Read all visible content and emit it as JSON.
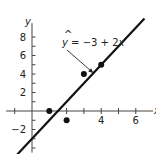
{
  "chart_data": {
    "type": "scatter",
    "title": "",
    "xlabel": "x",
    "ylabel": "y",
    "xlim": [
      -1.5,
      7
    ],
    "ylim": [
      -4.5,
      9.5
    ],
    "grid": false,
    "x_ticks": [
      -1,
      1,
      2,
      3,
      4,
      5,
      6
    ],
    "x_tick_labels": [
      {
        "value": 4,
        "label": "4"
      },
      {
        "value": 6,
        "label": "6"
      }
    ],
    "y_ticks": [
      -4,
      -3,
      -2,
      -1,
      1,
      2,
      3,
      4,
      5,
      6,
      7,
      8
    ],
    "y_tick_labels": [
      {
        "value": 8,
        "label": "8"
      },
      {
        "value": 6,
        "label": "6"
      },
      {
        "value": 4,
        "label": "4"
      },
      {
        "value": 2,
        "label": "2"
      },
      {
        "value": -2,
        "label": "−2"
      }
    ],
    "points": [
      {
        "x": 1,
        "y": 0
      },
      {
        "x": 2,
        "y": -1
      },
      {
        "x": 3,
        "y": 4
      },
      {
        "x": 4,
        "y": 5
      }
    ],
    "regression_line": {
      "intercept": -3,
      "slope": 2,
      "x_range": [
        -0.45,
        6.5
      ]
    },
    "annotation": {
      "hat": "^",
      "text_var": "y",
      "text_rest": " = −3 + 2",
      "text_x": "x",
      "arrow_to": {
        "x": 3.55,
        "y": 4.1
      }
    }
  }
}
